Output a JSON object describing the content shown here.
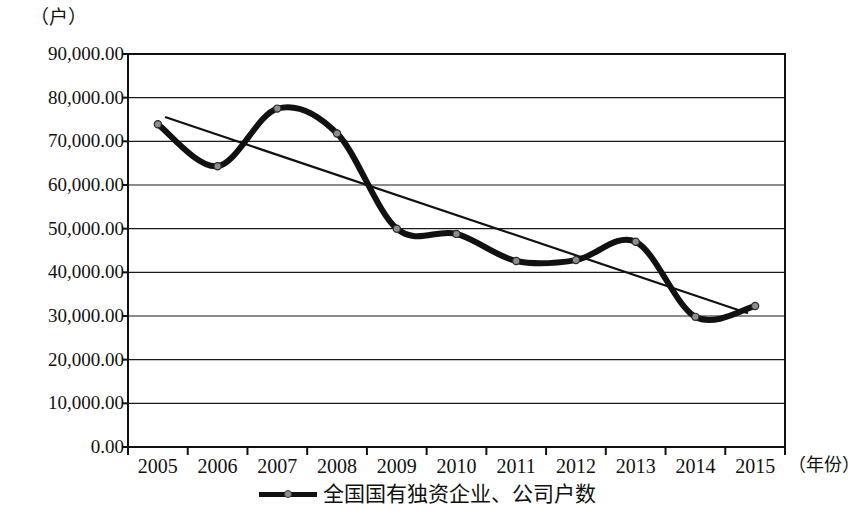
{
  "chart_data": {
    "type": "line",
    "title": "",
    "subtitle": "",
    "unit_label": "（户）",
    "xlabel": "（年份）",
    "ylabel": "",
    "categories": [
      "2005",
      "2006",
      "2007",
      "2008",
      "2009",
      "2010",
      "2011",
      "2012",
      "2013",
      "2014",
      "2015"
    ],
    "series": [
      {
        "name": "全国国有独资企业、公司户数",
        "values": [
          73900,
          64300,
          77500,
          71800,
          50000,
          48800,
          42600,
          42800,
          47000,
          29800,
          32300
        ],
        "color": "#111111",
        "marker": "circle",
        "smoothed": true
      },
      {
        "name": "线性趋势线",
        "type": "trendline",
        "from": 75500,
        "to": 30700,
        "color": "#111111"
      }
    ],
    "ylim": [
      0,
      90000
    ],
    "ytick_labels": [
      "90,000.00",
      "80,000.00",
      "70,000.00",
      "60,000.00",
      "50,000.00",
      "40,000.00",
      "30,000.00",
      "20,000.00",
      "10,000.00",
      "0.00"
    ],
    "ytick_values": [
      90000,
      80000,
      70000,
      60000,
      50000,
      40000,
      30000,
      20000,
      10000,
      0
    ],
    "grid": true,
    "grid_axis": "y",
    "legend_position": "bottom",
    "legend": [
      {
        "label": "全国国有独资企业、公司户数",
        "color": "#111111",
        "marker": "circle"
      }
    ]
  }
}
